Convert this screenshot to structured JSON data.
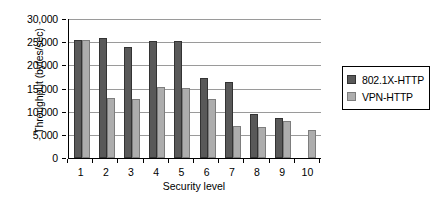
{
  "chart_data": {
    "type": "bar",
    "title": "",
    "xlabel": "Security level",
    "ylabel": "Throughput (bytes/sec)",
    "categories": [
      "1",
      "2",
      "3",
      "4",
      "5",
      "6",
      "7",
      "8",
      "9",
      "10"
    ],
    "series": [
      {
        "name": "802.1X-HTTP",
        "color": "#595959",
        "values": [
          25500,
          25800,
          24000,
          25200,
          25200,
          17200,
          16300,
          9500,
          8700,
          null
        ]
      },
      {
        "name": "VPN-HTTP",
        "color": "#adadad",
        "values": [
          25400,
          12900,
          12700,
          15300,
          15200,
          12800,
          7000,
          6800,
          7900,
          6000
        ]
      }
    ],
    "ylim": [
      0,
      30000
    ],
    "ytick_values": [
      0,
      5000,
      10000,
      15000,
      20000,
      25000,
      30000
    ],
    "ytick_labels": [
      "0",
      "5,000",
      "10,000",
      "15,000",
      "20,000",
      "25,000",
      "30,000"
    ],
    "grid": true,
    "grid_axis": "y",
    "legend_position": "right"
  },
  "legend": {
    "entries": [
      {
        "label": "802.1X-HTTP"
      },
      {
        "label": "VPN-HTTP"
      }
    ]
  }
}
